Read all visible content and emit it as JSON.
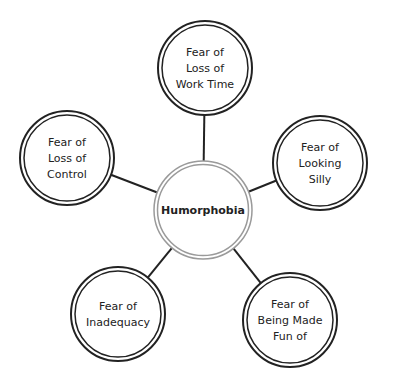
{
  "diagram": {
    "center": {
      "label": "Humorphobia"
    },
    "nodes": [
      {
        "id": "work-time",
        "lines": [
          "Fear of",
          "Loss of",
          "Work Time"
        ]
      },
      {
        "id": "looking-silly",
        "lines": [
          "Fear of",
          "Looking",
          "Silly"
        ]
      },
      {
        "id": "made-fun-of",
        "lines": [
          "Fear of",
          "Being Made",
          "Fun of"
        ]
      },
      {
        "id": "inadequacy",
        "lines": [
          "Fear of",
          "Inadequacy"
        ]
      },
      {
        "id": "loss-of-control",
        "lines": [
          "Fear of",
          "Loss of",
          "Control"
        ]
      }
    ],
    "colors": {
      "outer_ring": "#222222",
      "center_ring": "#9a9a9a",
      "connector": "#222222"
    }
  }
}
